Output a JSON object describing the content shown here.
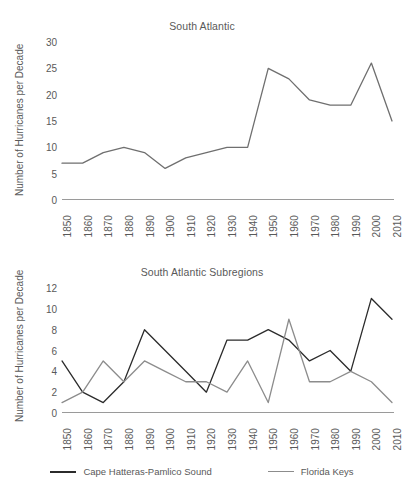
{
  "figure": {
    "background": "#ffffff",
    "text_color": "#595959",
    "axis_color": "#9a9a9a"
  },
  "legend": {
    "position": "bottom-center",
    "entries": [
      {
        "label": "Cape Hatteras-Pamlico Sound",
        "color": "#2b2b2b"
      },
      {
        "label": "Florida Keys",
        "color": "#8c8c8c"
      }
    ]
  },
  "chart_data": [
    {
      "id": "south-atlantic",
      "type": "line",
      "title": "South Atlantic",
      "xlabel": "",
      "ylabel": "Number of Hurricanes per Decade",
      "grid": false,
      "legend": false,
      "categories": [
        "1850",
        "1860",
        "1870",
        "1880",
        "1890",
        "1900",
        "1910",
        "1920",
        "1930",
        "1940",
        "1950",
        "1960",
        "1970",
        "1980",
        "1990",
        "2000",
        "2010"
      ],
      "xticklabels": [
        "1850",
        "1860",
        "1870",
        "1880",
        "1890",
        "1900",
        "1910",
        "1920",
        "1930",
        "1940",
        "1950",
        "1960",
        "1970",
        "1980",
        "1990",
        "2000",
        "2010"
      ],
      "yticks": [
        0,
        5,
        10,
        15,
        20,
        25,
        30
      ],
      "ylim": [
        0,
        30
      ],
      "series": [
        {
          "name": "South Atlantic",
          "color": "#6f6f6f",
          "values": [
            7,
            7,
            9,
            10,
            9,
            6,
            8,
            9,
            10,
            10,
            25,
            23,
            19,
            18,
            18,
            26,
            15
          ]
        }
      ]
    },
    {
      "id": "south-atlantic-subregions",
      "type": "line",
      "title": "South Atlantic Subregions",
      "xlabel": "",
      "ylabel": "Number of Hurricanes per Decade",
      "grid": false,
      "legend": true,
      "categories": [
        "1850",
        "1860",
        "1870",
        "1880",
        "1890",
        "1900",
        "1910",
        "1920",
        "1930",
        "1940",
        "1950",
        "1960",
        "1970",
        "1980",
        "1990",
        "2000",
        "2010"
      ],
      "xticklabels": [
        "1850",
        "1860",
        "1870",
        "1880",
        "1890",
        "1900",
        "1910",
        "1920",
        "1930",
        "1940",
        "1950",
        "1960",
        "1970",
        "1980",
        "1990",
        "2000",
        "2010"
      ],
      "yticks": [
        0,
        2,
        4,
        6,
        8,
        10,
        12
      ],
      "ylim": [
        0,
        12
      ],
      "series": [
        {
          "name": "Cape Hatteras-Pamlico Sound",
          "color": "#2b2b2b",
          "values": [
            5,
            2,
            1,
            3,
            8,
            6,
            4,
            2,
            7,
            7,
            8,
            7,
            5,
            6,
            4,
            11,
            9
          ]
        },
        {
          "name": "Florida Keys",
          "color": "#8c8c8c",
          "values": [
            1,
            2,
            5,
            3,
            5,
            4,
            3,
            3,
            2,
            5,
            1,
            9,
            3,
            3,
            4,
            3,
            1
          ]
        }
      ]
    }
  ]
}
